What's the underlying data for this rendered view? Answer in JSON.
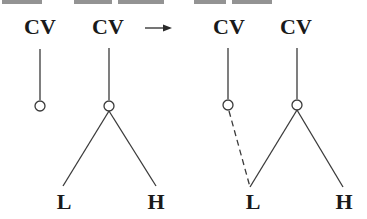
{
  "diagram": {
    "left": {
      "units": [
        {
          "label": "CV",
          "x": 40,
          "node_x": 40
        },
        {
          "label": "CV",
          "x": 108,
          "node_x": 109
        }
      ],
      "tones": [
        {
          "label": "L",
          "x": 64
        },
        {
          "label": "H",
          "x": 156
        }
      ]
    },
    "arrow": {
      "symbol": "→",
      "x1": 145,
      "x2": 172,
      "y": 28
    },
    "right": {
      "units": [
        {
          "label": "CV",
          "x": 229,
          "node_x": 228
        },
        {
          "label": "CV",
          "x": 296,
          "node_x": 297
        }
      ],
      "tones": [
        {
          "label": "L",
          "x": 253
        },
        {
          "label": "H",
          "x": 344
        }
      ],
      "spread_link": "dashed"
    },
    "colors": {
      "ink": "#1a1a1a",
      "line": "#3a3a3a",
      "background": "#ffffff"
    }
  }
}
